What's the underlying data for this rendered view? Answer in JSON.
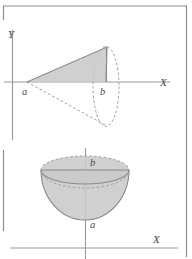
{
  "figure": {
    "background_color": "#ffffff",
    "frame_color": "#8d8d8d",
    "axis_color": "#9a9a9a",
    "solid_fill_color": "#c9c9c9",
    "dashed_stroke_color": "#9d9d9d",
    "label_color": "#4a4a4a"
  },
  "upper_panel": {
    "name": "cone-figure",
    "axes": {
      "y_label": "Y",
      "x_label": "X",
      "origin": {
        "x": 12,
        "y": 82
      }
    },
    "points": [
      {
        "label": "a",
        "x": 27,
        "y": 82,
        "role": "cone-apex-on-axis"
      },
      {
        "label": "b",
        "x": 106,
        "y": 82,
        "role": "cone-base-center-on-axis"
      }
    ],
    "shape": {
      "type": "cone",
      "apex": {
        "x": 27,
        "y": 82
      },
      "base_center": {
        "x": 106,
        "y": 82
      },
      "base_rx": 13,
      "base_ry": 40,
      "top_vertex": {
        "x": 107,
        "y": 47
      },
      "bottom_vertex": {
        "x": 107,
        "y": 126
      },
      "shaded_triangle": [
        {
          "x": 27,
          "y": 82
        },
        {
          "x": 107,
          "y": 47
        },
        {
          "x": 106,
          "y": 82
        }
      ]
    }
  },
  "lower_panel": {
    "name": "hemisphere-figure",
    "axes": {
      "x_label": "X",
      "x_axis_y": 248,
      "vertical_axis_x": 85
    },
    "points": [
      {
        "label": "b",
        "x": 85,
        "y": 163,
        "role": "hemisphere-rim-center"
      },
      {
        "label": "a",
        "x": 85,
        "y": 219,
        "role": "hemisphere-bottom-pole"
      }
    ],
    "shape": {
      "type": "hemisphere",
      "center": {
        "x": 85,
        "y": 170
      },
      "rx": 44,
      "ry": 14,
      "depth_ry": 50
    }
  }
}
